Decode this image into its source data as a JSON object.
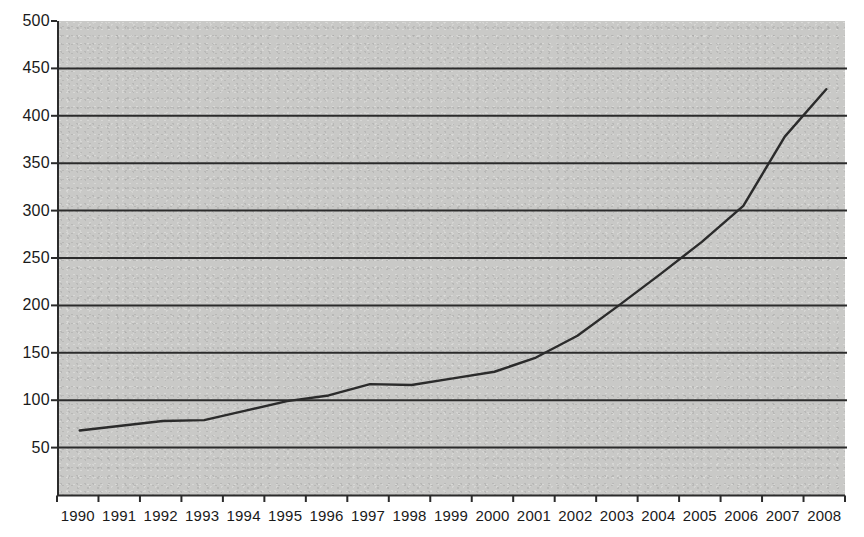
{
  "chart_data": {
    "type": "line",
    "title": "",
    "subtitle": "",
    "xlabel": "",
    "ylabel": "",
    "categories": [
      "1990",
      "1991",
      "1992",
      "1993",
      "1994",
      "1995",
      "1996",
      "1997",
      "1998",
      "1999",
      "2000",
      "2001",
      "2002",
      "2003",
      "2004",
      "2005",
      "2006",
      "2007",
      "2008"
    ],
    "values": [
      68,
      73,
      78,
      79,
      89,
      99,
      105,
      117,
      116,
      123,
      130,
      145,
      168,
      200,
      233,
      267,
      305,
      378,
      428
    ],
    "series": [
      {
        "name": "",
        "values": [
          68,
          73,
          78,
          79,
          89,
          99,
          105,
          117,
          116,
          123,
          130,
          145,
          168,
          200,
          233,
          267,
          305,
          378,
          428
        ]
      }
    ],
    "ylim": [
      0,
      500
    ],
    "yticks": [
      50,
      100,
      150,
      200,
      250,
      300,
      350,
      400,
      450,
      500
    ],
    "ytick_labels": [
      "50",
      "100",
      "150",
      "200",
      "250",
      "300",
      "350",
      "400",
      "450",
      "500"
    ],
    "xtick_labels": [
      "1990",
      "1991",
      "1992",
      "1993",
      "1994",
      "1995",
      "1996",
      "1997",
      "1998",
      "1999",
      "2000",
      "2001",
      "2002",
      "2003",
      "2004",
      "2005",
      "2006",
      "2007",
      "2008"
    ],
    "grid": true,
    "grid_axis": "y",
    "legend": false,
    "legend_position": "none",
    "annotations": [],
    "colors": {
      "plot_background": "#c9c9c7",
      "page_background": "#ffffff",
      "line": "#2b2b2b",
      "gridline": "#2b2b2b",
      "axis": "#2b2b2b",
      "tick_label": "#1a1a1a"
    }
  }
}
